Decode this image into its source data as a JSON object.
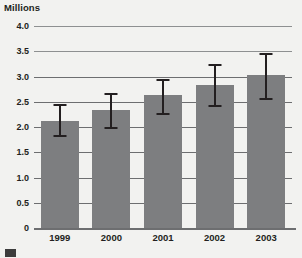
{
  "chart_data": {
    "type": "bar",
    "title": "",
    "ylabel": "Millions",
    "xlabel": "",
    "categories": [
      "1999",
      "2000",
      "2001",
      "2002",
      "2003"
    ],
    "values": [
      2.12,
      2.33,
      2.63,
      2.84,
      3.02
    ],
    "error_low": [
      1.81,
      1.97,
      2.24,
      2.4,
      2.54
    ],
    "error_high": [
      2.46,
      2.68,
      2.96,
      3.25,
      3.46
    ],
    "ylim": [
      0,
      4.0
    ],
    "ytick_labels": [
      "4.0",
      "3.5",
      "3.0",
      "2.5",
      "2.0",
      "1.5",
      "1.0",
      "0.5",
      "0"
    ],
    "ytick_values": [
      4.0,
      3.5,
      3.0,
      2.5,
      2.0,
      1.5,
      1.0,
      0.5,
      0
    ],
    "grid": true,
    "legend": "",
    "bar_color": "#7d7e80",
    "error_bar_color": "#231f20",
    "grid_color": "#6d6e70",
    "background_color": "#f2f2f0"
  },
  "footer": {
    "swatch_label": "legend-swatch"
  }
}
